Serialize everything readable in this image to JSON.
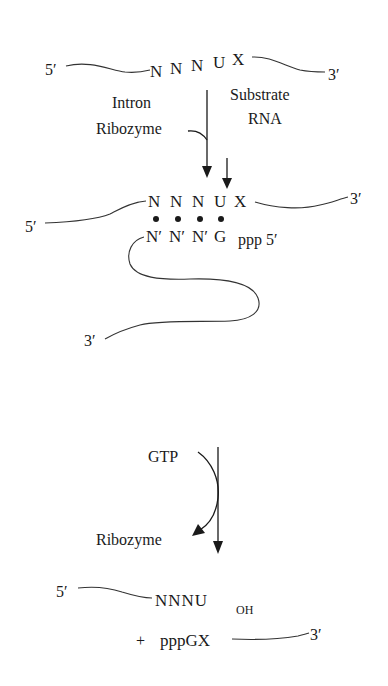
{
  "diagram": {
    "title": "",
    "step1": {
      "substrate": {
        "five_prime": "5′",
        "three_prime": "3′",
        "bases": [
          "N",
          "N",
          "N",
          "U",
          "X"
        ]
      },
      "labels": {
        "intron_line1": "Intron",
        "intron_line2": "Ribozyme",
        "substrate_line1": "Substrate",
        "substrate_line2": "RNA"
      }
    },
    "step2": {
      "substrate": {
        "five_prime": "5′",
        "three_prime": "3′",
        "bases": [
          "N",
          "N",
          "N",
          "U",
          "X"
        ]
      },
      "guide": {
        "bases": [
          "N′",
          "N′",
          "N′",
          "G"
        ],
        "tail": "ppp 5′",
        "three_prime": "3′"
      },
      "pairing_dots": 4
    },
    "step3": {
      "cofactor": "GTP",
      "catalyst": "Ribozyme"
    },
    "products": {
      "product1": {
        "five_prime": "5′",
        "sequence": "NNNU",
        "subscript": "OH"
      },
      "product2": {
        "plus": "+",
        "sequence": "pppGX",
        "three_prime": "3′"
      }
    }
  }
}
